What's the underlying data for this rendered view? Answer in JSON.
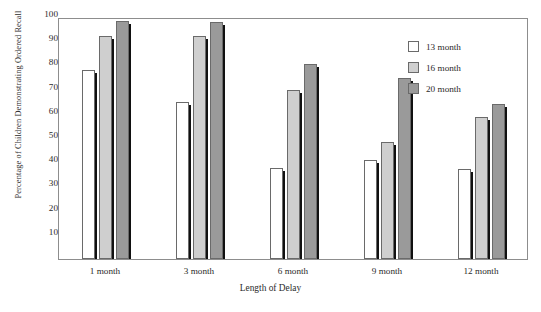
{
  "chart_data": {
    "type": "bar",
    "title": "",
    "xlabel": "Length of Delay",
    "ylabel": "Percentage of Children Demonstrating Ordered Recall",
    "categories": [
      "1 month",
      "3 month",
      "6 month",
      "9 month",
      "12 month"
    ],
    "ylim": [
      0,
      100
    ],
    "yticks": [
      10,
      20,
      30,
      40,
      50,
      60,
      70,
      80,
      90,
      100
    ],
    "grid": false,
    "legend_position": "top-right",
    "series": [
      {
        "name": "13 month",
        "color": "#ffffff",
        "values": [
          78,
          65,
          37.5,
          41,
          37
        ]
      },
      {
        "name": "16 month",
        "color": "#cfcfcf",
        "values": [
          92,
          92,
          70,
          48.5,
          58.5
        ]
      },
      {
        "name": "20 month",
        "color": "#9a9a9a",
        "values": [
          98.5,
          98,
          80.5,
          75,
          64
        ]
      }
    ]
  },
  "axis": {
    "y_title": "Percentage of Children Demonstrating Ordered Recall",
    "x_title": "Length of Delay"
  },
  "legend": {
    "items": [
      {
        "label": "13 month"
      },
      {
        "label": "16 month"
      },
      {
        "label": "20 month"
      }
    ]
  },
  "caption": {
    "text": ""
  }
}
